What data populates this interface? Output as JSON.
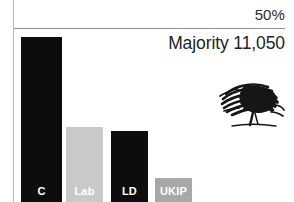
{
  "chart_data": {
    "type": "bar",
    "title": "",
    "categories": [
      "C",
      "Lab",
      "LD",
      "UKIP"
    ],
    "values": [
      47.5,
      21.5,
      20.5,
      7.0
    ],
    "series": [
      {
        "name": "Share of vote",
        "values": [
          47.5,
          21.5,
          20.5,
          7.0
        ]
      }
    ],
    "bar_colors": [
      "#0d0d0d",
      "#c9c9c9",
      "#0d0d0d",
      "#a8a8a8"
    ],
    "label_colors": [
      "#ffffff",
      "#ffffff",
      "#ffffff",
      "#ffffff"
    ],
    "xlabel": "",
    "ylabel": "",
    "ylim": [
      0,
      52.5
    ],
    "gridlines": [
      {
        "value": 50,
        "label": "50%"
      }
    ],
    "grid": true,
    "legend": "none",
    "annotations": [
      {
        "text": "Majority 11,050",
        "position": "top-right"
      }
    ]
  },
  "axis": {
    "tick_50_label": "50%"
  },
  "annotation": {
    "majority_text": "Majority 11,050"
  },
  "bars": [
    {
      "label": "C",
      "value": 47.5,
      "color": "#0d0d0d",
      "label_color": "#ffffff"
    },
    {
      "label": "Lab",
      "value": 21.5,
      "color": "#c9c9c9",
      "label_color": "#ffffff"
    },
    {
      "label": "LD",
      "value": 20.5,
      "color": "#0d0d0d",
      "label_color": "#ffffff"
    },
    {
      "label": "UKIP",
      "value": 7.0,
      "color": "#a8a8a8",
      "label_color": "#ffffff"
    }
  ],
  "emblem": {
    "name": "oak-tree-sketch",
    "color": "#161616"
  }
}
